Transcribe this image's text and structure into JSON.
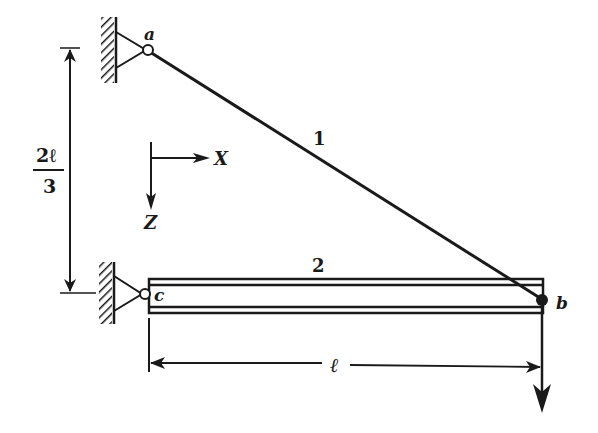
{
  "diagram": {
    "nodes": {
      "a": "a",
      "b": "b",
      "c": "c"
    },
    "members": {
      "bar1": "1",
      "bar2": "2"
    },
    "axes": {
      "x": "X",
      "z": "Z"
    },
    "dimensions": {
      "height_numerator": "2ℓ",
      "height_denominator": "3",
      "length": "ℓ"
    },
    "colors": {
      "ink": "#1a1a1a",
      "background": "#ffffff"
    }
  }
}
